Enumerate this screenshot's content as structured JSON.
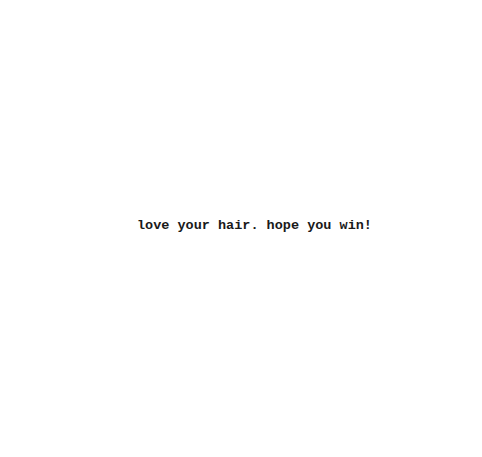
{
  "message": {
    "text": "love your hair. hope you win!"
  },
  "colors": {
    "background": "#ffffff",
    "text": "#1a1a1a"
  }
}
